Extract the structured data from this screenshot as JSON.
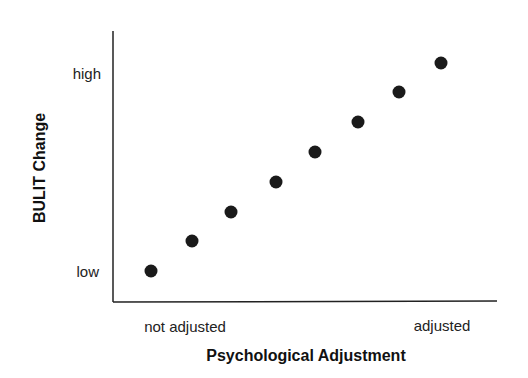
{
  "chart_data": {
    "type": "scatter",
    "title": "",
    "xlabel": "Psychological Adjustment",
    "ylabel": "BULIT Change",
    "x_tick_labels": [
      "not adjusted",
      "adjusted"
    ],
    "y_tick_labels": [
      "low",
      "high"
    ],
    "grid": false,
    "legend": null,
    "xlim": [
      0,
      8
    ],
    "ylim": [
      0,
      8
    ],
    "series": [
      {
        "name": "points",
        "x": [
          0.5,
          1.5,
          2.5,
          3.5,
          4.5,
          5.5,
          6.5,
          7.5
        ],
        "y": [
          0.5,
          1.5,
          2.5,
          3.5,
          4.5,
          5.5,
          6.5,
          7.5
        ],
        "color": "#1a1a1a"
      }
    ],
    "points_px": [
      [
        151,
        271
      ],
      [
        192,
        241
      ],
      [
        231,
        212
      ],
      [
        276,
        182
      ],
      [
        315,
        152
      ],
      [
        358,
        122
      ],
      [
        399,
        92
      ],
      [
        441,
        63
      ]
    ]
  },
  "axes": {
    "x_title": "Psychological Adjustment",
    "y_title": "BULIT Change",
    "x_low": "not adjusted",
    "x_high": "adjusted",
    "y_low": "low",
    "y_high": "high"
  }
}
